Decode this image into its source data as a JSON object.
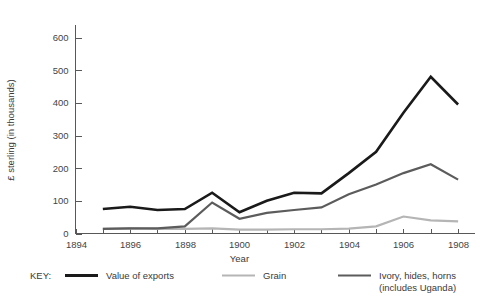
{
  "chart_data": {
    "type": "line",
    "title": "",
    "xlabel": "Year",
    "ylabel": "£ sterling (in thousands)",
    "xlim": [
      1894,
      1908.6
    ],
    "ylim": [
      0,
      640
    ],
    "grid": false,
    "legend_position": "below",
    "legend_prefix": "KEY:",
    "xticks": [
      "1894",
      "1896",
      "1898",
      "1900",
      "1902",
      "1904",
      "1906",
      "1908"
    ],
    "xtick_values": [
      1894,
      1896,
      1898,
      1900,
      1902,
      1904,
      1906,
      1908
    ],
    "xminor_values": [
      1895,
      1897,
      1899,
      1901,
      1903,
      1905,
      1907
    ],
    "yticks": [
      "0",
      "100",
      "200",
      "300",
      "400",
      "500",
      "600"
    ],
    "ytick_values": [
      0,
      100,
      200,
      300,
      400,
      500,
      600
    ],
    "x": [
      1895,
      1896,
      1897,
      1898,
      1899,
      1900,
      1901,
      1902,
      1903,
      1904,
      1905,
      1906,
      1907,
      1908
    ],
    "series": [
      {
        "name": "Value of exports",
        "color": "#1a1a1a",
        "width": 2.6,
        "values": [
          75,
          82,
          72,
          75,
          125,
          65,
          100,
          125,
          123,
          185,
          250,
          370,
          480,
          395
        ]
      },
      {
        "name": "Grain",
        "color": "#b5b5b5",
        "width": 2.2,
        "values": [
          14,
          16,
          14,
          14,
          16,
          12,
          12,
          13,
          13,
          15,
          22,
          52,
          40,
          37
        ]
      },
      {
        "name": "Ivory, hides, horns (includes Uganda)",
        "name_line1": "Ivory, hides, horns",
        "name_line2": "(includes Uganda)",
        "color": "#5c5c5c",
        "width": 2.2,
        "values": [
          14,
          16,
          16,
          22,
          95,
          45,
          63,
          72,
          80,
          120,
          150,
          185,
          212,
          165
        ]
      }
    ]
  },
  "legend": {
    "prefix": "KEY:",
    "entries": [
      {
        "label": "Value of exports",
        "label_line2": "",
        "color": "#1a1a1a"
      },
      {
        "label": "Grain",
        "label_line2": "",
        "color": "#b5b5b5"
      },
      {
        "label": "Ivory, hides, horns",
        "label_line2": "(includes Uganda)",
        "color": "#5c5c5c"
      }
    ]
  }
}
